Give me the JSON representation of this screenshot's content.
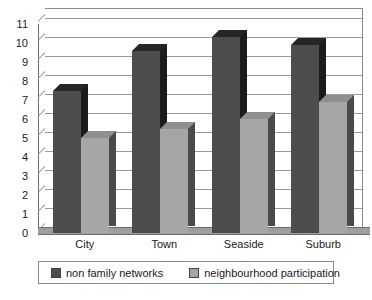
{
  "chart_data": {
    "type": "bar",
    "title": "",
    "subtitle": "",
    "xlabel": "",
    "ylabel": "",
    "categories": [
      "City",
      "Town",
      "Seaside",
      "Suburb"
    ],
    "series": [
      {
        "name": "non family networks",
        "values": [
          7.5,
          9.6,
          10.3,
          9.9
        ],
        "color": "#4d4d4d"
      },
      {
        "name": "neighbourhood participation",
        "values": [
          5.0,
          5.5,
          6.0,
          6.9
        ],
        "color": "#a6a6a6"
      }
    ],
    "ylim": [
      0,
      11
    ],
    "ytick_labels": [
      "0",
      "1",
      "2",
      "3",
      "4",
      "5",
      "6",
      "7",
      "8",
      "9",
      "10",
      "11"
    ],
    "grid": true,
    "legend_position": "bottom",
    "three_d": true,
    "annotations": []
  },
  "axis": {
    "y_ticks": [
      "11",
      "10",
      "9",
      "8",
      "7",
      "6",
      "5",
      "4",
      "3",
      "2",
      "1",
      "0"
    ]
  },
  "legend": {
    "entries": [
      {
        "label": "non family networks",
        "color": "#4d4d4d"
      },
      {
        "label": "neighbourhood participation",
        "color": "#a6a6a6"
      }
    ]
  },
  "colors": {
    "series_dark_front": "#4d4d4d",
    "series_dark_side": "#1c1c1c",
    "series_dark_top": "#262626",
    "series_light_front": "#a6a6a6",
    "series_light_side": "#4a4a4a",
    "series_light_top": "#8f8f8f",
    "gridline": "#9a9a9a",
    "frame": "#8a8a8a",
    "floor": "#9e9e9e",
    "text": "#1a1a1a",
    "background": "#ffffff"
  }
}
